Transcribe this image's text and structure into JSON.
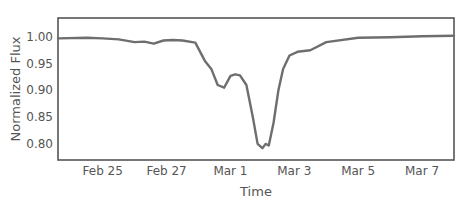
{
  "chart_data": {
    "type": "line",
    "title": "",
    "xlabel": "Time",
    "ylabel": "Normalized Flux",
    "x_tick_labels": [
      "Feb 25",
      "Feb 27",
      "Mar 1",
      "Mar 3",
      "Mar 5",
      "Mar 7"
    ],
    "x_tick_days": [
      1,
      3,
      5,
      7,
      9,
      11
    ],
    "y_tick_labels": [
      "1.00",
      "0.95",
      "0.90",
      "0.85",
      "0.80"
    ],
    "y_ticks": [
      1.0,
      0.95,
      0.9,
      0.85,
      0.8
    ],
    "xlim_days": [
      -0.4,
      12.0
    ],
    "ylim": [
      0.77,
      1.035
    ],
    "grid": false,
    "legend": null,
    "line_color": "#6e6e6e",
    "series": [
      {
        "name": "Normalized Flux",
        "x_days": [
          -0.4,
          0.5,
          1.0,
          1.5,
          2.0,
          2.3,
          2.6,
          2.9,
          3.2,
          3.5,
          3.9,
          4.2,
          4.4,
          4.6,
          4.8,
          5.0,
          5.15,
          5.3,
          5.5,
          5.7,
          5.85,
          6.0,
          6.1,
          6.2,
          6.35,
          6.5,
          6.65,
          6.85,
          7.1,
          7.5,
          8.0,
          9.0,
          10.0,
          11.0,
          12.0
        ],
        "values": [
          0.997,
          0.998,
          0.997,
          0.995,
          0.99,
          0.991,
          0.987,
          0.993,
          0.994,
          0.993,
          0.989,
          0.955,
          0.94,
          0.91,
          0.905,
          0.927,
          0.93,
          0.928,
          0.91,
          0.85,
          0.8,
          0.792,
          0.8,
          0.797,
          0.84,
          0.9,
          0.94,
          0.965,
          0.972,
          0.975,
          0.99,
          0.998,
          0.999,
          1.001,
          1.002
        ]
      }
    ]
  }
}
